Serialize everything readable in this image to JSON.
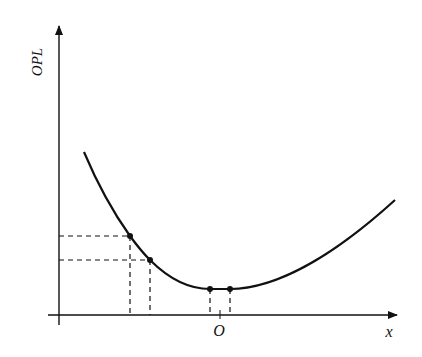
{
  "diagram": {
    "y_axis_label": "OPL",
    "x_axis_label": "x",
    "origin_label": "O",
    "colors": {
      "line": "#111111",
      "background": "#ffffff"
    },
    "curve_description": "Convex optical path length curve with minimum near O",
    "marked_points": [
      {
        "id": "p1",
        "dashed_to_axes": true
      },
      {
        "id": "p2",
        "dashed_to_axes": true
      },
      {
        "id": "p3",
        "dashed_to_x_axis": true
      },
      {
        "id": "p4",
        "dashed_to_x_axis": true
      }
    ]
  }
}
